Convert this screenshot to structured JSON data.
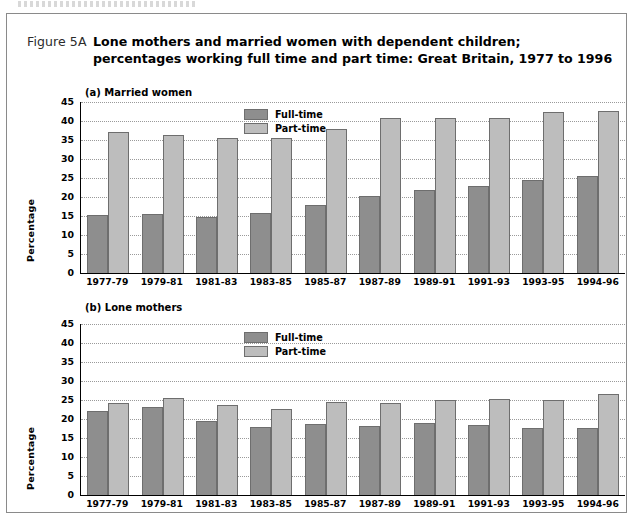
{
  "figure": {
    "number": "Figure 5A",
    "title": "Lone mothers and married women with dependent children; percentages working full time and part time: Great Britain, 1977 to 1996"
  },
  "legend": {
    "full_time": "Full-time",
    "part_time": "Part-time",
    "colors": {
      "full_time": "#8e8e8e",
      "part_time": "#bdbdbd"
    }
  },
  "axis": {
    "ylabel": "Percentage",
    "yticks": [
      "45",
      "40",
      "35",
      "30",
      "25",
      "20",
      "15",
      "10",
      "5",
      "0"
    ]
  },
  "panels": {
    "a": {
      "title": "(a) Married women"
    },
    "b": {
      "title": "(b) Lone mothers"
    }
  },
  "chart_data": [
    {
      "type": "bar",
      "title": "(a) Married women",
      "xlabel": "",
      "ylabel": "Percentage",
      "ylim": [
        0,
        45
      ],
      "ytick_step": 5,
      "grid": true,
      "legend_position": "inside-top-center",
      "categories": [
        "1977-79",
        "1979-81",
        "1981-83",
        "1983-85",
        "1985-87",
        "1987-89",
        "1989-91",
        "1991-93",
        "1993-95",
        "1994-96"
      ],
      "series": [
        {
          "name": "Full-time",
          "color": "#8e8e8e",
          "values": [
            15.3,
            15.4,
            14.7,
            15.8,
            18.0,
            20.2,
            21.8,
            23.0,
            24.6,
            25.5
          ]
        },
        {
          "name": "Part-time",
          "color": "#bdbdbd",
          "values": [
            37.2,
            36.4,
            35.4,
            35.6,
            37.8,
            40.7,
            40.7,
            40.7,
            42.4,
            42.6
          ]
        }
      ]
    },
    {
      "type": "bar",
      "title": "(b) Lone mothers",
      "xlabel": "",
      "ylabel": "Percentage",
      "ylim": [
        0,
        45
      ],
      "ytick_step": 5,
      "grid": true,
      "legend_position": "inside-top-center",
      "categories": [
        "1977-79",
        "1979-81",
        "1981-83",
        "1983-85",
        "1985-87",
        "1987-89",
        "1989-91",
        "1991-93",
        "1993-95",
        "1994-96"
      ],
      "series": [
        {
          "name": "Full-time",
          "color": "#8e8e8e",
          "values": [
            22.0,
            23.2,
            19.4,
            17.8,
            18.7,
            18.1,
            19.0,
            18.4,
            17.7,
            17.7
          ]
        },
        {
          "name": "Part-time",
          "color": "#bdbdbd",
          "values": [
            24.3,
            25.4,
            23.8,
            22.6,
            24.6,
            24.1,
            25.0,
            25.2,
            25.0,
            26.6
          ]
        }
      ]
    }
  ]
}
